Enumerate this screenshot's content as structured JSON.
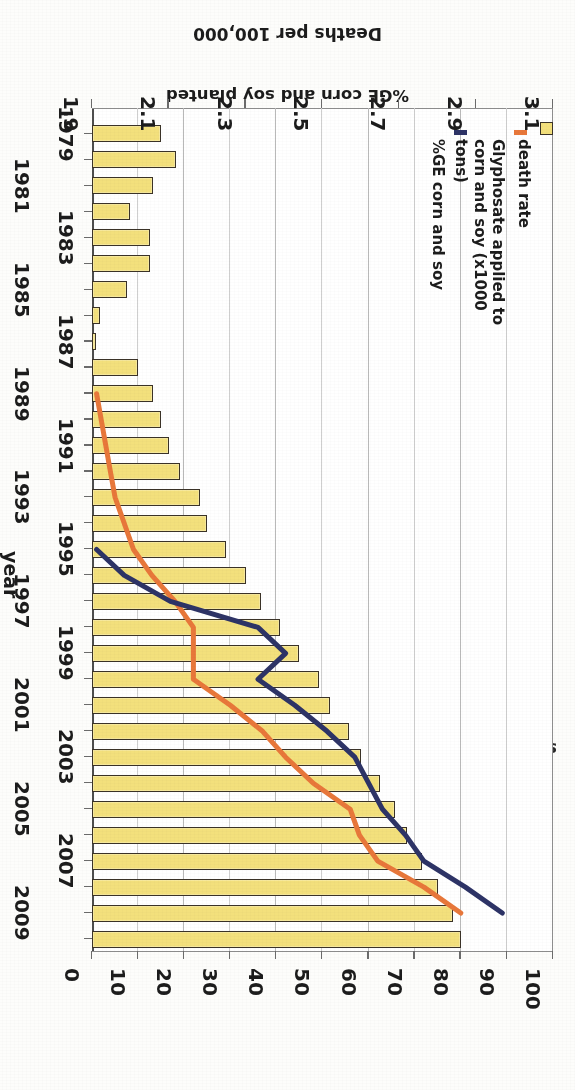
{
  "source_note": "sources: USDA:NASS; CDC",
  "axes": {
    "value_axis_title_line1": "glyphosate applied (1,000 tons)",
    "value_axis_title_line2": "%GE corn and soy planted",
    "value_ticks": [
      0,
      10,
      20,
      30,
      40,
      50,
      60,
      70,
      80,
      90,
      100
    ],
    "year_axis_title": "year",
    "year_ticks": [
      1979,
      1981,
      1983,
      1985,
      1987,
      1989,
      1991,
      1993,
      1995,
      1997,
      1999,
      2001,
      2003,
      2005,
      2007,
      2009
    ],
    "death_axis_title": "Deaths per 100,000",
    "death_ticks": [
      "1.9",
      "2.1",
      "2.3",
      "2.5",
      "2.7",
      "2.9",
      "3.1"
    ]
  },
  "legend": {
    "items": [
      {
        "label": "death rate",
        "color": "#f3e07c",
        "marker": "bar-swatch-icon"
      },
      {
        "label": "Glyphosate applied to\ncorn and soy (x1000\ntons)",
        "color": "#e8773a",
        "marker": "line-swatch-icon"
      },
      {
        "label": "%GE corn and soy",
        "color": "#2d3366",
        "marker": "line-swatch-icon"
      }
    ]
  },
  "chart_data": {
    "type": "bar",
    "title": "",
    "subtitle": "",
    "orientation": "horizontal",
    "grid": true,
    "legend_position": "left-bottom",
    "categories": [
      1979,
      1980,
      1981,
      1982,
      1983,
      1984,
      1985,
      1986,
      1987,
      1988,
      1989,
      1990,
      1991,
      1992,
      1993,
      1994,
      1995,
      1996,
      1997,
      1998,
      1999,
      2000,
      2001,
      2002,
      2003,
      2004,
      2005,
      2006,
      2007,
      2008,
      2009,
      2010
    ],
    "xlabel": "glyphosate applied (1,000 tons) / %GE corn and soy planted",
    "ylabel": "year",
    "xlim": [
      0,
      100
    ],
    "secondary_ylabel": "Deaths per 100,000",
    "secondary_ylim": [
      1.9,
      3.1
    ],
    "series": [
      {
        "name": "death rate",
        "type": "bar",
        "axis": "secondary",
        "units": "Deaths per 100,000",
        "values": [
          2.08,
          2.12,
          2.06,
          2.0,
          2.05,
          2.05,
          1.99,
          1.92,
          1.91,
          2.02,
          2.06,
          2.08,
          2.1,
          2.13,
          2.18,
          2.2,
          2.25,
          2.3,
          2.34,
          2.39,
          2.44,
          2.49,
          2.52,
          2.57,
          2.6,
          2.65,
          2.69,
          2.72,
          2.76,
          2.8,
          2.84,
          2.86
        ]
      },
      {
        "name": "Glyphosate applied to corn and soy (x1000 tons)",
        "type": "line",
        "axis": "primary",
        "color": "#e8773a",
        "units": "1,000 tons",
        "x": [
          1989,
          1990,
          1991,
          1992,
          1993,
          1994,
          1995,
          1996,
          1997,
          1998,
          1999,
          2000,
          2001,
          2002,
          2003,
          2004,
          2005,
          2006,
          2007,
          2008,
          2009
        ],
        "values": [
          1,
          2,
          3,
          4,
          5,
          7,
          9,
          13,
          18,
          22,
          22,
          22,
          30,
          37,
          42,
          48,
          56,
          58,
          62,
          72,
          80
        ]
      },
      {
        "name": "%GE corn and soy",
        "type": "line",
        "axis": "primary",
        "color": "#2d3366",
        "units": "%",
        "x": [
          1995,
          1996,
          1997,
          1998,
          1999,
          2000,
          2001,
          2002,
          2003,
          2004,
          2005,
          2006,
          2007,
          2008,
          2009
        ],
        "values": [
          1,
          7,
          17,
          36,
          42,
          36,
          44,
          51,
          57,
          60,
          63,
          68,
          72,
          81,
          89
        ]
      }
    ],
    "annotations": [
      "sources: USDA:NASS; CDC"
    ]
  }
}
